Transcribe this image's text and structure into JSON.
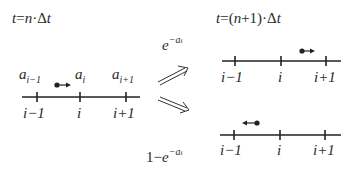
{
  "title_left": {
    "t": "t",
    "eq": "=",
    "n": "n",
    "dot": "·",
    "delta": "Δ",
    "t2": "t"
  },
  "title_right": {
    "t": "t",
    "eq": "=",
    "lp": "(",
    "n": "n",
    "plus1": "+1",
    "rp": ")",
    "dot": "·",
    "delta": "Δ",
    "t2": "t"
  },
  "stay_prob": {
    "base": "e",
    "exp": "−a",
    "exp_sub": "i"
  },
  "jump_prob": {
    "one": "1",
    "minus": "−",
    "base": "e",
    "exp": "−a",
    "exp_sub": "i"
  },
  "left_state": {
    "site_values": [
      {
        "base": "a",
        "sub": "i−1"
      },
      {
        "base": "a",
        "sub": "i"
      },
      {
        "base": "a",
        "sub": "i+1"
      }
    ],
    "site_labels": [
      "i−1",
      "i",
      "i+1"
    ],
    "particle_direction": "right"
  },
  "upper_outcome": {
    "site_labels": [
      "i−1",
      "i",
      "i+1"
    ],
    "particle_direction": "right"
  },
  "lower_outcome": {
    "site_labels": [
      "i−1",
      "i",
      "i+1"
    ],
    "particle_direction": "left"
  },
  "colors": {
    "ink": "#222222",
    "background": "#ffffff"
  }
}
